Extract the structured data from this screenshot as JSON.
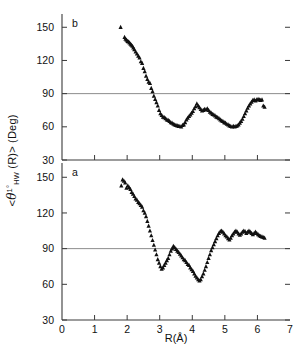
{
  "figure": {
    "width": 304,
    "height": 355,
    "axis_color": "#3a3a3a",
    "marker_color": "#101010",
    "refline_color": "#8c8c8c"
  },
  "axes": {
    "ylabel_prefix": "<",
    "ylabel_theta": "θ",
    "ylabel_sup": "1°",
    "ylabel_sub": "HW",
    "ylabel_arg": "(R)> (Deg)",
    "ylabel_full": "<θ1°HW (R)> (Deg)",
    "xlabel": "R(Å)",
    "ytick_labels": [
      "30",
      "60",
      "90",
      "120",
      "150"
    ],
    "ytick_values": [
      30,
      60,
      90,
      120,
      150
    ],
    "xtick_labels": [
      "0",
      "1",
      "2",
      "3",
      "4",
      "5",
      "6",
      "7"
    ],
    "xtick_values": [
      0,
      1,
      2,
      3,
      4,
      5,
      6,
      7
    ],
    "xlim": [
      0,
      7
    ],
    "ylim": [
      30,
      162
    ],
    "reference_line_y": 90
  },
  "panels": {
    "top_label": "b",
    "bottom_label": "a"
  },
  "chart_data": [
    {
      "type": "scatter",
      "name": "panel-b",
      "panel_label": "b",
      "title": "",
      "xlabel": "R(Å)",
      "ylabel": "<θ1°HW (R)> (Deg)",
      "xlim": [
        0,
        7
      ],
      "ylim": [
        30,
        162
      ],
      "grid": false,
      "reference_line_y": 90,
      "marker": "triangle-up",
      "x": [
        1.8,
        1.92,
        1.95,
        1.98,
        2.01,
        2.04,
        2.07,
        2.1,
        2.13,
        2.16,
        2.19,
        2.22,
        2.26,
        2.3,
        2.34,
        2.38,
        2.42,
        2.46,
        2.5,
        2.54,
        2.58,
        2.62,
        2.66,
        2.7,
        2.74,
        2.78,
        2.82,
        2.86,
        2.9,
        2.94,
        2.98,
        3.02,
        3.06,
        3.1,
        3.14,
        3.18,
        3.22,
        3.26,
        3.3,
        3.34,
        3.38,
        3.42,
        3.46,
        3.5,
        3.54,
        3.58,
        3.62,
        3.66,
        3.7,
        3.74,
        3.78,
        3.82,
        3.86,
        3.9,
        3.94,
        3.98,
        4.02,
        4.06,
        4.1,
        4.14,
        4.18,
        4.22,
        4.26,
        4.3,
        4.34,
        4.38,
        4.42,
        4.46,
        4.5,
        4.54,
        4.58,
        4.62,
        4.66,
        4.7,
        4.74,
        4.78,
        4.82,
        4.86,
        4.9,
        4.94,
        4.98,
        5.02,
        5.06,
        5.1,
        5.14,
        5.18,
        5.22,
        5.26,
        5.3,
        5.34,
        5.38,
        5.42,
        5.46,
        5.5,
        5.54,
        5.58,
        5.62,
        5.66,
        5.7,
        5.74,
        5.78,
        5.82,
        5.86,
        5.9,
        5.94,
        5.98,
        6.02,
        6.06,
        6.1,
        6.14,
        6.18,
        6.22
      ],
      "y": [
        150.0,
        141.0,
        139.5,
        138.5,
        137.5,
        137.0,
        136.0,
        135.0,
        134.0,
        133.0,
        131.5,
        130.0,
        128.0,
        126.0,
        124.0,
        122.5,
        119.0,
        117.5,
        113.0,
        110.0,
        106.0,
        103.0,
        100.5,
        99.5,
        95.0,
        92.0,
        88.0,
        85.0,
        82.0,
        79.0,
        75.0,
        72.0,
        70.5,
        69.0,
        68.5,
        67.5,
        66.5,
        66.0,
        65.0,
        64.0,
        63.5,
        62.5,
        62.0,
        61.5,
        61.0,
        60.5,
        60.5,
        60.0,
        61.5,
        62.0,
        64.0,
        66.5,
        68.0,
        69.5,
        71.0,
        72.5,
        74.0,
        76.5,
        78.5,
        81.0,
        79.0,
        77.5,
        76.0,
        74.5,
        75.0,
        76.0,
        75.5,
        76.5,
        75.0,
        73.5,
        72.5,
        71.5,
        71.0,
        70.0,
        69.0,
        68.5,
        67.5,
        66.5,
        65.5,
        65.0,
        64.0,
        63.5,
        62.5,
        62.0,
        61.0,
        60.5,
        60.0,
        60.5,
        60.0,
        60.5,
        61.0,
        62.0,
        63.5,
        65.0,
        67.0,
        69.5,
        72.0,
        74.5,
        77.0,
        79.0,
        81.0,
        82.5,
        84.0,
        84.5,
        83.5,
        84.5,
        85.0,
        84.5,
        84.0,
        84.5,
        79.0,
        78.0
      ]
    },
    {
      "type": "scatter",
      "name": "panel-a",
      "panel_label": "a",
      "title": "",
      "xlabel": "R(Å)",
      "ylabel": "<θ1°HW (R)> (Deg)",
      "xlim": [
        0,
        7
      ],
      "ylim": [
        30,
        162
      ],
      "grid": false,
      "reference_line_y": 90,
      "marker": "triangle-up",
      "x": [
        1.82,
        1.86,
        1.9,
        1.94,
        1.98,
        2.02,
        2.06,
        2.1,
        2.14,
        2.18,
        2.22,
        2.26,
        2.3,
        2.34,
        2.38,
        2.42,
        2.46,
        2.5,
        2.54,
        2.58,
        2.62,
        2.66,
        2.7,
        2.74,
        2.78,
        2.82,
        2.86,
        2.9,
        2.94,
        2.98,
        3.02,
        3.06,
        3.1,
        3.14,
        3.18,
        3.22,
        3.26,
        3.3,
        3.34,
        3.38,
        3.42,
        3.46,
        3.5,
        3.54,
        3.58,
        3.62,
        3.66,
        3.7,
        3.74,
        3.78,
        3.82,
        3.86,
        3.9,
        3.94,
        3.98,
        4.02,
        4.06,
        4.1,
        4.14,
        4.18,
        4.22,
        4.26,
        4.3,
        4.34,
        4.38,
        4.42,
        4.46,
        4.5,
        4.54,
        4.58,
        4.62,
        4.66,
        4.7,
        4.74,
        4.78,
        4.82,
        4.86,
        4.9,
        4.94,
        4.98,
        5.02,
        5.06,
        5.1,
        5.14,
        5.18,
        5.22,
        5.26,
        5.3,
        5.34,
        5.38,
        5.42,
        5.46,
        5.5,
        5.54,
        5.58,
        5.62,
        5.66,
        5.7,
        5.74,
        5.78,
        5.82,
        5.86,
        5.9,
        5.94,
        5.98,
        6.02,
        6.06,
        6.1,
        6.14,
        6.18,
        6.22
      ],
      "y": [
        143.0,
        148.0,
        147.0,
        145.5,
        141.0,
        143.0,
        141.5,
        140.0,
        137.5,
        136.0,
        134.0,
        132.0,
        131.0,
        129.0,
        128.0,
        126.5,
        125.0,
        122.0,
        120.0,
        117.0,
        113.0,
        109.0,
        105.0,
        101.0,
        97.0,
        93.0,
        89.0,
        85.0,
        81.0,
        78.0,
        75.0,
        73.0,
        74.0,
        76.0,
        78.0,
        80.0,
        82.0,
        85.0,
        88.0,
        90.0,
        92.0,
        91.0,
        89.5,
        88.0,
        87.0,
        85.5,
        84.0,
        82.5,
        81.0,
        80.0,
        78.5,
        77.0,
        76.0,
        74.0,
        72.5,
        71.0,
        69.0,
        67.0,
        65.5,
        64.0,
        63.0,
        64.0,
        66.5,
        69.0,
        72.0,
        75.0,
        78.5,
        82.0,
        85.0,
        88.5,
        91.0,
        93.5,
        96.0,
        98.5,
        101.0,
        103.0,
        104.5,
        105.0,
        104.0,
        102.5,
        101.0,
        100.0,
        98.5,
        97.5,
        99.0,
        101.0,
        102.5,
        104.0,
        105.0,
        104.0,
        102.5,
        101.5,
        102.5,
        104.0,
        105.0,
        104.5,
        103.0,
        104.0,
        105.0,
        104.0,
        103.0,
        102.0,
        103.0,
        104.0,
        103.0,
        102.0,
        101.0,
        100.5,
        100.0,
        99.5,
        99.0
      ]
    }
  ]
}
